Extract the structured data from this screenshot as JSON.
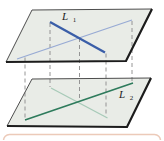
{
  "figure": {
    "labels": {
      "l1": {
        "base": "L",
        "sub": "1"
      },
      "l2": {
        "base": "L",
        "sub": "2"
      }
    },
    "colors": {
      "background": "#ffffff",
      "plane_fill": "#e9ece7",
      "plane_edge_thin": "#4d4d4d",
      "plane_edge_bold": "#1c1c1c",
      "line_l1": "#3a5ea8",
      "line_l2": "#2e7b5c",
      "l2_projection_top_plane": "#97aad4",
      "l1_projection_bottom_plane": "#a7cab8",
      "dashed_connector": "#8a8a8a",
      "label_text": "#1b1b1b",
      "frame_border": "#eccab9"
    }
  }
}
